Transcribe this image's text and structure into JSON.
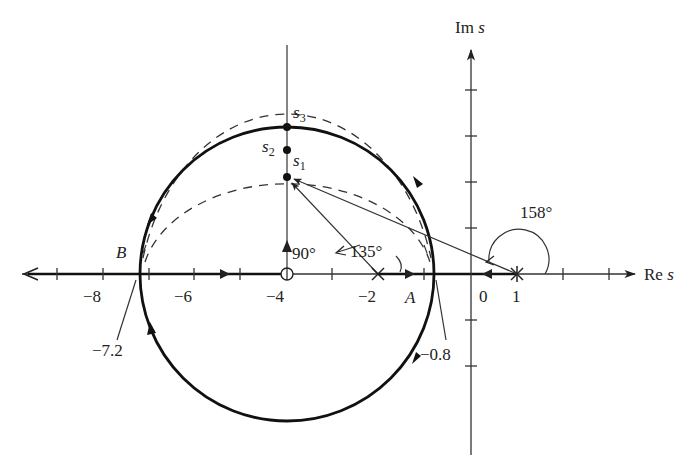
{
  "figure": {
    "axes": {
      "real_label": "Re",
      "real_label_var": "s",
      "imag_label": "Im",
      "imag_label_var": "s",
      "real_ticks": [
        {
          "value": -8,
          "label": "−8"
        },
        {
          "value": -6,
          "label": "−6"
        },
        {
          "value": -4,
          "label": "−4"
        },
        {
          "value": -2,
          "label": "−2"
        },
        {
          "value": 0,
          "label": "0"
        },
        {
          "value": 1,
          "label": "1"
        }
      ]
    },
    "poles": [
      {
        "re": -2,
        "im": 0,
        "symbol": "×"
      },
      {
        "re": 1,
        "im": 0,
        "symbol": "×"
      }
    ],
    "zeros": [
      {
        "re": -4,
        "im": 0,
        "symbol": "○"
      }
    ],
    "circle": {
      "center_re": -4,
      "center_im": 0,
      "radius": 3.2
    },
    "breakpoints": {
      "B": {
        "label": "B",
        "value_label": "−7.2"
      },
      "A": {
        "label": "A",
        "value_label": "−0.8"
      }
    },
    "test_points": [
      {
        "name": "s",
        "sub": "1"
      },
      {
        "name": "s",
        "sub": "2"
      },
      {
        "name": "s",
        "sub": "3"
      }
    ],
    "angles": {
      "zero_angle": "90°",
      "pole_minus2_angle": "135°",
      "pole_plus1_angle": "158°"
    }
  }
}
